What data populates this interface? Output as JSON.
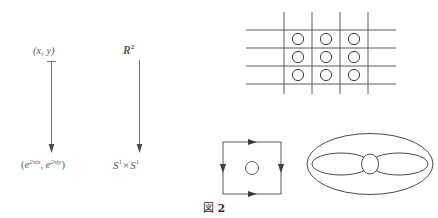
{
  "figure": {
    "caption_label": "図",
    "caption_number": "2",
    "caption_full": "図 2",
    "background_color": "#ffffff",
    "ink_color": "#4a4a4a"
  },
  "covering_map": {
    "source_point_label": "(x, y)",
    "source_space_label": "R",
    "source_space_exponent": "2",
    "target_point_label_open": "(",
    "target_point_first": "e",
    "target_point_first_exp": "2πix",
    "target_point_sep": ", ",
    "target_point_second": "e",
    "target_point_second_exp": "2πiy",
    "target_point_close": ")",
    "target_space_first": "S",
    "target_space_first_exp": "1",
    "target_space_times": "×",
    "target_space_second": "S",
    "target_space_second_exp": "1",
    "arrow_left_name": "point-map-arrow",
    "arrow_right_name": "space-map-arrow",
    "arrow_direction": "down"
  },
  "lattice": {
    "description": "integer lattice grid in the plane",
    "horizontal_line_count": 4,
    "vertical_line_count": 4,
    "horizontal_line_y": [
      22,
      40,
      58,
      76
    ],
    "vertical_line_x": [
      38,
      66,
      94,
      122
    ],
    "horizontal_line_x_start": 0,
    "horizontal_line_x_end": 150,
    "vertical_line_y_start": 4,
    "vertical_line_y_end": 86,
    "circle_rows": 3,
    "circle_cols": 3,
    "circle_radius": 6,
    "circle_centers_x": [
      52,
      80,
      108
    ],
    "circle_centers_y": [
      31,
      49,
      67
    ],
    "line_color": "#5a5a5a",
    "circle_color": "#3c3c3c"
  },
  "fundamental_square": {
    "description": "unit square with edge identification arrows and interior circle",
    "left": 10,
    "top": 6,
    "width": 58,
    "height": 52,
    "edge_arrows": [
      {
        "edge": "top",
        "direction": "right"
      },
      {
        "edge": "bottom",
        "direction": "right"
      },
      {
        "edge": "left",
        "direction": "down"
      },
      {
        "edge": "right",
        "direction": "down"
      }
    ],
    "interior_circle_radius": 7,
    "line_color": "#5a5a5a"
  },
  "torus": {
    "description": "torus drawn as outer ellipse with two lens curves and a central circle",
    "outer_ellipse": {
      "cx": 67,
      "cy": 38,
      "rx": 64,
      "ry": 31
    },
    "center_circle": {
      "cx": 67,
      "cy": 38,
      "rx": 9,
      "ry": 10
    },
    "left_lens": {
      "cx": 38,
      "cy": 38,
      "rx": 29,
      "ry": 11
    },
    "right_lens": {
      "cx": 96,
      "cy": 38,
      "rx": 29,
      "ry": 11
    },
    "line_color": "#4a4a4a"
  }
}
